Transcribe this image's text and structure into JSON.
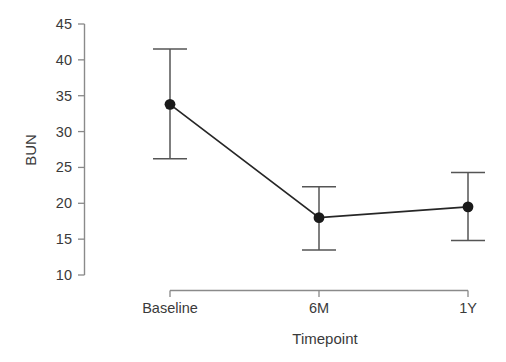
{
  "chart_data": {
    "type": "line",
    "title": "",
    "subtitle": "",
    "xlabel": "Timepoint",
    "ylabel": "BUN",
    "categories": [
      "Baseline",
      "6M",
      "1Y"
    ],
    "values": [
      33.8,
      18.0,
      19.5
    ],
    "error_low": [
      26.2,
      13.5,
      14.8
    ],
    "error_high": [
      41.5,
      22.3,
      24.3
    ],
    "series": [
      {
        "name": "BUN",
        "values": [
          33.8,
          18.0,
          19.5
        ],
        "error_low": [
          26.2,
          13.5,
          14.8
        ],
        "error_high": [
          41.5,
          22.3,
          24.3
        ]
      }
    ],
    "ylim": [
      8.0,
      46.5
    ],
    "yticks": [
      10,
      15,
      20,
      25,
      30,
      35,
      40,
      45
    ],
    "ytick_labels": [
      "10",
      "15",
      "20",
      "25",
      "30",
      "35",
      "40",
      "45"
    ],
    "xtick_labels": [
      "Baseline",
      "6M",
      "1Y"
    ],
    "grid": false,
    "legend": false,
    "legend_position": "none",
    "marker": "circle",
    "colors": {
      "line": "#262626",
      "marker": "#1a1a1a",
      "errorbar": "#555555",
      "axis": "#888888",
      "text": "#3a3a3a",
      "background": "#ffffff"
    }
  }
}
